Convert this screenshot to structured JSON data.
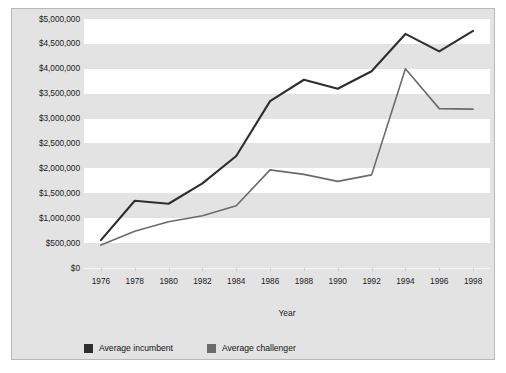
{
  "chart_data": {
    "type": "line",
    "title": "",
    "xlabel": "Year",
    "ylabel": "",
    "categories": [
      1976,
      1978,
      1980,
      1982,
      1984,
      1986,
      1988,
      1990,
      1992,
      1994,
      1996,
      1998
    ],
    "x_tick_labels": [
      "1976",
      "1978",
      "1980",
      "1982",
      "1984",
      "1986",
      "1988",
      "1990",
      "1992",
      "1994",
      "1996",
      "1998"
    ],
    "y_tick_labels": [
      "$5,000,000",
      "$4,500,000",
      "$4,000,000",
      "$3,500,000",
      "$3,000,000",
      "$2,500,000",
      "$2,000,000",
      "$1,500,000",
      "$1,000,000",
      "$500,000",
      "$0"
    ],
    "y_tick_values": [
      5000000,
      4500000,
      4000000,
      3500000,
      3000000,
      2500000,
      2000000,
      1500000,
      1000000,
      500000,
      0
    ],
    "ylim": [
      0,
      5000000
    ],
    "grid": "horizontal-alternating-bands",
    "legend_position": "bottom-left",
    "series": [
      {
        "name": "Average incumbent",
        "color": "#2e2e2e",
        "values": [
          560000,
          1350000,
          1290000,
          1700000,
          2250000,
          3350000,
          3780000,
          3600000,
          3950000,
          4700000,
          4350000,
          4760000
        ]
      },
      {
        "name": "Average challenger",
        "color": "#6b6b6b",
        "values": [
          460000,
          740000,
          930000,
          1050000,
          1250000,
          1970000,
          1880000,
          1740000,
          1870000,
          4000000,
          3200000,
          3190000
        ]
      }
    ]
  },
  "legend": {
    "items": [
      {
        "label": "Average incumbent",
        "color": "#2e2e2e",
        "swatch": "legend-swatch-incumbent"
      },
      {
        "label": "Average challenger",
        "color": "#6b6b6b",
        "swatch": "legend-swatch-challenger"
      }
    ]
  },
  "axis": {
    "x_title": "Year"
  },
  "colors": {
    "panel_background": "#e3e3e3",
    "band_color": "#ffffff",
    "panel_border": "#b9b9b9",
    "incumbent": "#2e2e2e",
    "challenger": "#6b6b6b",
    "text": "#1a1a1a"
  }
}
